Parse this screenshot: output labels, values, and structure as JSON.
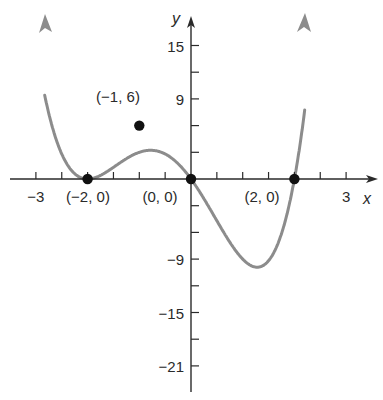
{
  "chart_data": {
    "type": "line",
    "title": "",
    "function": "f(x) = x(x+2)^2(x-2)",
    "xlabel": "x",
    "ylabel": "y",
    "xlim": [
      -3.2,
      3.5
    ],
    "ylim": [
      -24,
      18.5
    ],
    "grid": false,
    "legend": null,
    "x_ticks": [
      -3,
      -2.5,
      -2,
      -1.5,
      -1,
      -0.5,
      0,
      0.5,
      1,
      1.5,
      2,
      2.5,
      3
    ],
    "x_tick_labels": [
      {
        "x": -3,
        "label": "−3"
      },
      {
        "x": 3,
        "label": "3"
      }
    ],
    "y_ticks": [
      -21,
      -18,
      -15,
      -12,
      -9,
      -6,
      -3,
      0,
      3,
      6,
      9,
      12,
      15
    ],
    "y_tick_labels": [
      {
        "y": 15,
        "label": "15"
      },
      {
        "y": 9,
        "label": "9"
      },
      {
        "y": -9,
        "label": "−9"
      },
      {
        "y": -15,
        "label": "−15"
      },
      {
        "y": -21,
        "label": "−21"
      }
    ],
    "series": [
      {
        "name": "f(x)",
        "color": "#8c8c8c",
        "x": [
          -2.85,
          -2.7,
          -2.5,
          -2.3,
          -2.15,
          -2.0,
          -1.85,
          -1.7,
          -1.5,
          -1.3,
          -1.1,
          -1.0,
          -0.8,
          -0.6,
          -0.4,
          -0.2,
          0.0,
          0.2,
          0.4,
          0.6,
          0.8,
          1.0,
          1.2,
          1.35,
          1.5,
          1.7,
          1.85,
          2.0,
          2.15,
          2.3
        ],
        "y": [
          17.5,
          9.3,
          3.4,
          0.66,
          0.1,
          0.0,
          0.27,
          0.87,
          2.25,
          3.56,
          4.3,
          3.0,
          3.5,
          5.1,
          4.37,
          1.27,
          0.0,
          -1.76,
          -3.72,
          -6.12,
          -8.96,
          -9.0,
          -15.87,
          -19.3,
          -16.4,
          -18.62,
          -9.7,
          0.0,
          1.4,
          9.1
        ]
      }
    ],
    "labeled_points": [
      {
        "x": -2,
        "y": 0,
        "label": "(−2, 0)"
      },
      {
        "x": -1,
        "y": 6,
        "label": "(−1, 6)"
      },
      {
        "x": 0,
        "y": 0,
        "label": "(0, 0)"
      },
      {
        "x": 2,
        "y": 0,
        "label": "(2, 0)"
      }
    ],
    "colors": {
      "axis": "#2a2a2a",
      "curve": "#8c8c8c",
      "point": "#111111"
    }
  }
}
